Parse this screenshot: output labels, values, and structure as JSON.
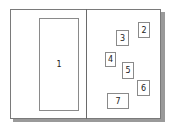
{
  "diagram": {
    "panels": [
      {
        "id": "left-panel"
      },
      {
        "id": "right-panel"
      }
    ],
    "boxes": [
      {
        "label": "1",
        "x": 39,
        "y": 18,
        "w": 40,
        "h": 93
      },
      {
        "label": "2",
        "x": 138,
        "y": 22,
        "w": 12,
        "h": 16
      },
      {
        "label": "3",
        "x": 116,
        "y": 30,
        "w": 13,
        "h": 16
      },
      {
        "label": "4",
        "x": 105,
        "y": 52,
        "w": 11,
        "h": 15
      },
      {
        "label": "5",
        "x": 122,
        "y": 62,
        "w": 12,
        "h": 17
      },
      {
        "label": "6",
        "x": 137,
        "y": 80,
        "w": 13,
        "h": 16
      },
      {
        "label": "7",
        "x": 107,
        "y": 93,
        "w": 22,
        "h": 16
      }
    ],
    "colors": {
      "frame_border": "#7a7a7a",
      "box_border": "#8a8a8a",
      "shadow": "#9a9a9a",
      "text": "#222222"
    }
  }
}
